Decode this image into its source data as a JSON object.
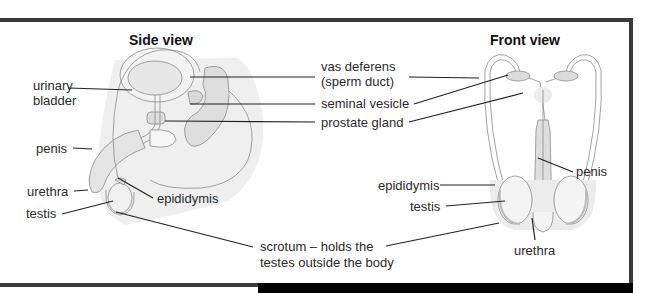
{
  "diagram": {
    "side_view": {
      "title": "Side view",
      "labels": {
        "urinary_bladder_1": "urinary",
        "urinary_bladder_2": "bladder",
        "penis": "penis",
        "urethra": "urethra",
        "testis": "testis",
        "epididymis": "epididymis"
      }
    },
    "front_view": {
      "title": "Front view",
      "labels": {
        "penis": "penis",
        "epididymis": "epididymis",
        "testis": "testis",
        "urethra": "urethra"
      }
    },
    "shared_labels": {
      "vas_deferens_1": "vas deferens",
      "vas_deferens_2": "(sperm duct)",
      "seminal_vesicle": "seminal vesicle",
      "prostate_gland": "prostate gland",
      "scrotum_1": "scrotum – holds the",
      "scrotum_2": "testes outside the body"
    },
    "colors": {
      "frame": "#3a3a3a",
      "tissue_fill": "#ebebeb",
      "organ_fill": "#dcdcdc",
      "outline": "#8a8a8a",
      "leader_line": "#222222"
    }
  }
}
